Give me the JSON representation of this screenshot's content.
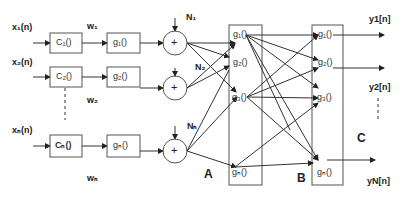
{
  "diagram": {
    "inputs": [
      {
        "label": "x₁(n)",
        "encoder": "C₁()",
        "nonlin": "g₁()",
        "weight": "w₁",
        "noise": "N₁"
      },
      {
        "label": "x₂(n)",
        "encoder": "C₂()",
        "nonlin": "g₂()",
        "weight": "w₂",
        "noise": "N₂"
      },
      {
        "label": "xₙ(n)",
        "encoder": "Cₙ()",
        "nonlin": "gₙ()",
        "weight": "wₙ",
        "noise": "Nₙ"
      }
    ],
    "sum_symbol": "+",
    "layer_a": {
      "label": "A",
      "nodes": [
        "g₁()",
        "g₂()",
        "g₃()",
        "gₙ()"
      ]
    },
    "layer_b": {
      "label": "B",
      "nodes": [
        "g₁()",
        "g₂()",
        "g₃()",
        "gₙ()"
      ]
    },
    "stage_c": {
      "label": "C"
    },
    "outputs": [
      "y1[n]",
      "y2[n]",
      "yN[n]"
    ],
    "colors": {
      "line": "#333333",
      "box": "#555555",
      "background": "#ffffff"
    }
  }
}
